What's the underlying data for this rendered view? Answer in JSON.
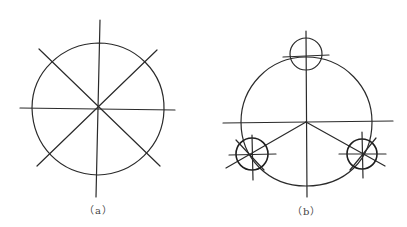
{
  "figure": {
    "panels": [
      {
        "id": "a",
        "label": "（a）",
        "description": "Circle divided into 8 equal sectors by 4 lines through the center",
        "circle": {
          "cx": 98,
          "cy": 108,
          "r": 66
        }
      },
      {
        "id": "b",
        "label": "（b）",
        "description": "Large circle with three small circles centered on its circumference at 120° spacing, with center lines",
        "circle": {
          "cx": 306,
          "cy": 122,
          "r": 65
        },
        "small_circles": [
          {
            "cx": 306,
            "cy": 54,
            "r": 16
          },
          {
            "cx": 252,
            "cy": 154,
            "r": 16
          },
          {
            "cx": 362,
            "cy": 154,
            "r": 15
          }
        ]
      }
    ]
  }
}
